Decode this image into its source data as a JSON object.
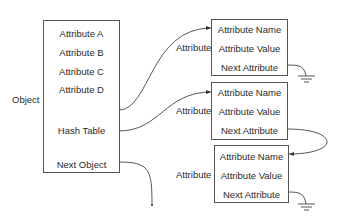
{
  "object": {
    "label": "Object",
    "fields": [
      "Attribute A",
      "Attribute B",
      "Attribute C",
      "Attribute D",
      "Hash Table",
      "Next Object"
    ]
  },
  "attributes": [
    {
      "label": "Attribute",
      "fields": [
        "Attribute Name",
        "Attribute Value",
        "Next Attribute"
      ]
    },
    {
      "label": "Attribute",
      "fields": [
        "Attribute Name",
        "Attribute Value",
        "Next Attribute"
      ]
    },
    {
      "label": "Attribute",
      "fields": [
        "Attribute Name",
        "Attribute Value",
        "Next Attribute"
      ]
    }
  ]
}
